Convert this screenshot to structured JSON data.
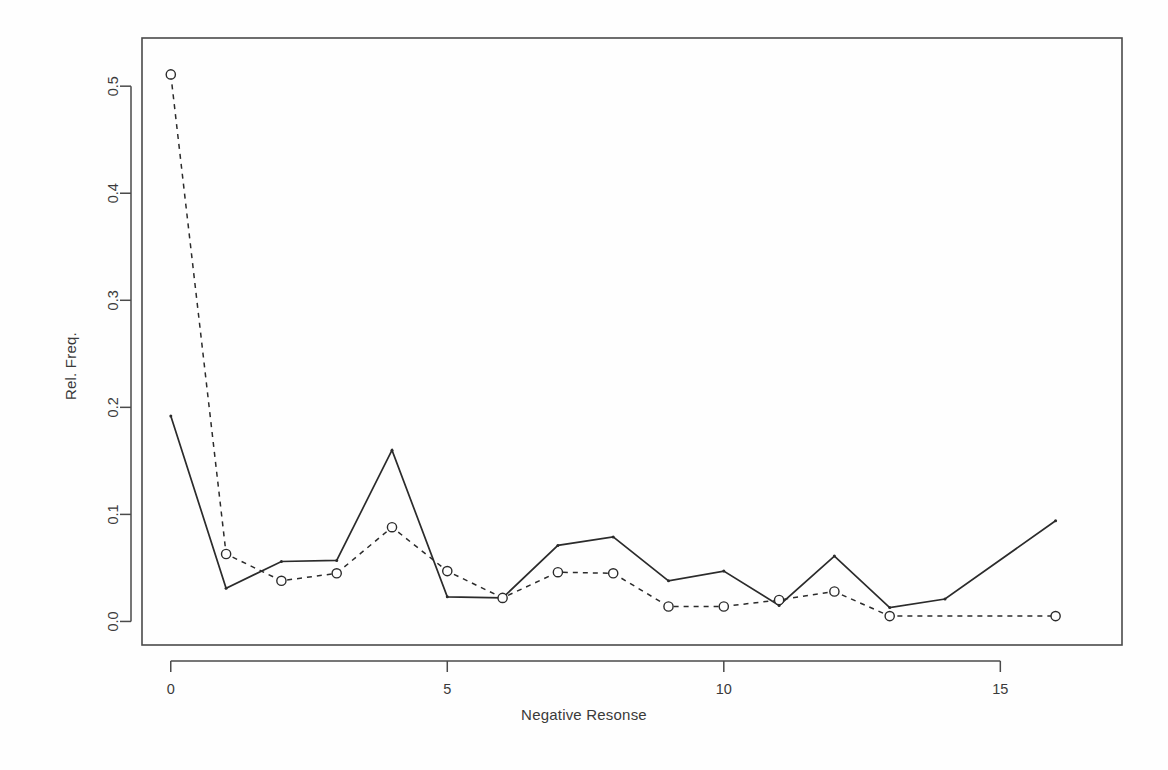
{
  "figure": {
    "background": "#fefefe",
    "frame_color": "#4a4a4a",
    "line_color": "#2b2b2b"
  },
  "axes": {
    "xlabel": "Negative Resonse",
    "ylabel": "Rel. Freq.",
    "x_ticks": [
      "0",
      "5",
      "10",
      "15"
    ],
    "x_tick_values": [
      0,
      5,
      10,
      15
    ],
    "y_ticks": [
      "0.0",
      "0.1",
      "0.2",
      "0.3",
      "0.4",
      "0.5"
    ],
    "y_tick_values": [
      0.0,
      0.1,
      0.2,
      0.3,
      0.4,
      0.5
    ]
  },
  "chart_data": {
    "type": "line",
    "title": "",
    "subtitle": "",
    "xlabel": "Negative Resonse",
    "ylabel": "Rel. Freq.",
    "xlim": [
      -0.52,
      17.2
    ],
    "ylim": [
      -0.022,
      0.545
    ],
    "grid": false,
    "legend": "none",
    "x": [
      0,
      1,
      2,
      3,
      4,
      5,
      6,
      7,
      8,
      9,
      10,
      11,
      12,
      13,
      14,
      16
    ],
    "series": [
      {
        "name": "observed",
        "linestyle": "solid",
        "marker": "point",
        "x": [
          0,
          1,
          2,
          3,
          4,
          5,
          6,
          7,
          8,
          9,
          10,
          11,
          12,
          13,
          14,
          16
        ],
        "values": [
          0.192,
          0.031,
          0.056,
          0.057,
          0.16,
          0.023,
          0.022,
          0.071,
          0.079,
          0.038,
          0.047,
          0.015,
          0.061,
          0.013,
          0.021,
          0.094
        ]
      },
      {
        "name": "fitted",
        "linestyle": "dashed",
        "marker": "circle",
        "x": [
          0,
          1,
          2,
          3,
          4,
          5,
          6,
          7,
          8,
          9,
          10,
          11,
          12,
          13,
          16
        ],
        "values": [
          0.511,
          0.063,
          0.038,
          0.045,
          0.088,
          0.047,
          0.022,
          0.046,
          0.045,
          0.014,
          0.014,
          0.02,
          0.028,
          0.005,
          0.005
        ]
      }
    ],
    "annotations": []
  }
}
